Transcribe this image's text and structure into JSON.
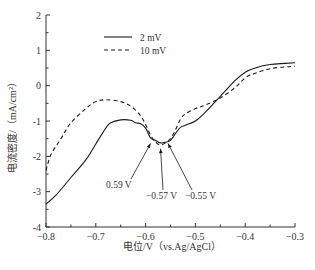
{
  "chart_data": {
    "type": "line",
    "title": "",
    "xlabel": "电位/V（vs.Ag/AgCl）",
    "ylabel": "电流密度/（mA/cm²）",
    "xlim": [
      -0.8,
      -0.3
    ],
    "ylim": [
      -4,
      2
    ],
    "x_ticks": [
      -0.8,
      -0.7,
      -0.6,
      -0.5,
      -0.4,
      -0.3
    ],
    "x_tick_labels": [
      "−0.8",
      "−0.7",
      "−0.6",
      "−0.5",
      "−0.4",
      "−0.3"
    ],
    "y_ticks": [
      2,
      1,
      0,
      -1,
      -2,
      -3,
      -4
    ],
    "y_tick_labels": [
      "2",
      "1",
      "0",
      "-1",
      "-2",
      "-3",
      "-4"
    ],
    "grid": false,
    "legend_position": "upper-left-inside",
    "series": [
      {
        "name": "2 mV",
        "style": "solid",
        "x": [
          -0.8,
          -0.78,
          -0.75,
          -0.72,
          -0.7,
          -0.68,
          -0.67,
          -0.65,
          -0.63,
          -0.62,
          -0.61,
          -0.6,
          -0.59,
          -0.58,
          -0.57,
          -0.56,
          -0.55,
          -0.54,
          -0.53,
          -0.52,
          -0.5,
          -0.48,
          -0.45,
          -0.42,
          -0.4,
          -0.38,
          -0.35,
          -0.32,
          -0.3
        ],
        "values": [
          -3.35,
          -3.1,
          -2.6,
          -2.1,
          -1.65,
          -1.2,
          -1.05,
          -0.97,
          -0.98,
          -1.05,
          -1.08,
          -1.2,
          -1.48,
          -1.55,
          -1.62,
          -1.6,
          -1.55,
          -1.35,
          -1.18,
          -1.12,
          -1.0,
          -0.75,
          -0.3,
          0.15,
          0.38,
          0.5,
          0.6,
          0.63,
          0.65
        ]
      },
      {
        "name": "10 mV",
        "style": "dashed",
        "x": [
          -0.8,
          -0.79,
          -0.77,
          -0.75,
          -0.72,
          -0.7,
          -0.68,
          -0.65,
          -0.63,
          -0.62,
          -0.61,
          -0.6,
          -0.59,
          -0.58,
          -0.57,
          -0.56,
          -0.55,
          -0.54,
          -0.53,
          -0.52,
          -0.5,
          -0.48,
          -0.45,
          -0.42,
          -0.4,
          -0.38,
          -0.35,
          -0.32,
          -0.3
        ],
        "values": [
          -2.4,
          -1.95,
          -1.5,
          -1.05,
          -0.65,
          -0.45,
          -0.4,
          -0.45,
          -0.58,
          -0.7,
          -0.85,
          -1.1,
          -1.4,
          -1.6,
          -1.68,
          -1.62,
          -1.5,
          -1.25,
          -0.95,
          -0.8,
          -0.65,
          -0.55,
          -0.35,
          -0.05,
          0.22,
          0.35,
          0.48,
          0.53,
          0.55
        ]
      }
    ],
    "annotations": [
      {
        "text": "0.59 V",
        "arrow_to": [
          -0.59,
          -1.55
        ]
      },
      {
        "text": "−0.57 V",
        "arrow_to": [
          -0.57,
          -1.7
        ]
      },
      {
        "text": "−0.55 V",
        "arrow_to": [
          -0.555,
          -1.55
        ]
      }
    ]
  },
  "legend": {
    "items": [
      {
        "label": "2 mV",
        "style": "solid"
      },
      {
        "label": "10 mV",
        "style": "dashed"
      }
    ]
  },
  "colors": {
    "line": "#1a1a1a",
    "axis": "#333333"
  }
}
